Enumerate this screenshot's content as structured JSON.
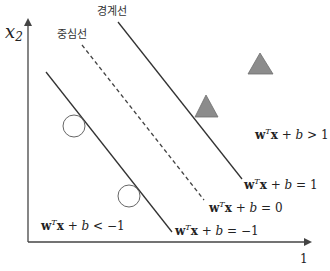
{
  "diagram": {
    "axes": {
      "y_label_main": "x",
      "y_label_sub": "2",
      "x_tick": "1",
      "color": "#444444"
    },
    "labels": {
      "boundary_line": "경계선",
      "center_line": "중심선"
    },
    "equations": {
      "positive_region": {
        "w": "w",
        "T": "T",
        "x": "x",
        "rest": " + ",
        "b": "b",
        "rel": " > 1"
      },
      "plus_one": {
        "w": "w",
        "T": "T",
        "x": "x",
        "rest": " + ",
        "b": "b",
        "rel": " = 1"
      },
      "zero": {
        "w": "w",
        "T": "T",
        "x": "x",
        "rest": " + ",
        "b": "b",
        "rel": " = 0"
      },
      "minus_one": {
        "w": "w",
        "T": "T",
        "x": "x",
        "rest": " + ",
        "b": "b",
        "rel": " = −1"
      },
      "negative_region": {
        "w": "w",
        "T": "T",
        "x": "x",
        "rest": " + ",
        "b": "b",
        "rel": " < −1"
      }
    },
    "markers": {
      "positive_class": {
        "shape": "triangle",
        "fill": "#8c8c8c",
        "stroke": "#6f6f6f",
        "count": 2
      },
      "negative_class": {
        "shape": "circle",
        "fill": "none",
        "stroke": "#666666",
        "count": 2
      }
    },
    "lines": {
      "boundary_plus": {
        "style": "solid",
        "color": "#333333"
      },
      "center": {
        "style": "dashed",
        "color": "#444444"
      },
      "boundary_minus": {
        "style": "solid",
        "color": "#333333"
      }
    }
  }
}
